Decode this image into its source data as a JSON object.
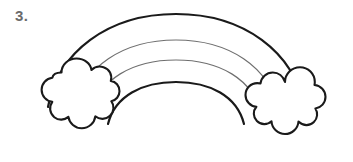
{
  "page": {
    "background_color": "#ffffff",
    "width": 353,
    "height": 162,
    "style": "black-and-white line art coloring page"
  },
  "item": {
    "number_label": "3.",
    "number_color": "#6b6b6b"
  },
  "figure": {
    "name": "rainbow-with-clouds",
    "fill_color": "#ffffff",
    "outline_color": "#1a1a1a",
    "inner_band_color": "#6f6f6f"
  },
  "rainbow": {
    "band_count": 3,
    "arc_line_count": 4,
    "arcs": [
      {
        "id": "arc-outer-top",
        "stroke": "#1a1a1a",
        "width": 2.2
      },
      {
        "id": "arc-inner-upper",
        "stroke": "#6f6f6f",
        "width": 1.2
      },
      {
        "id": "arc-inner-lower",
        "stroke": "#6f6f6f",
        "width": 1.2
      },
      {
        "id": "arc-outer-bottom",
        "stroke": "#1a1a1a",
        "width": 2.2
      }
    ]
  },
  "clouds": [
    {
      "id": "cloud-left",
      "position": "left",
      "lobe_count": 7,
      "stroke": "#1a1a1a",
      "fill": "#ffffff"
    },
    {
      "id": "cloud-right",
      "position": "right",
      "lobe_count": 7,
      "stroke": "#1a1a1a",
      "fill": "#ffffff"
    }
  ]
}
